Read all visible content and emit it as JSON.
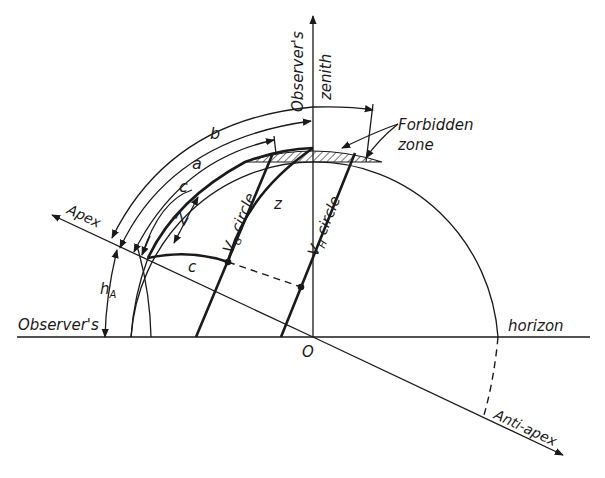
{
  "diagram": {
    "type": "celestial-geometry",
    "labels": {
      "zenith_line1": "Observer's",
      "zenith_line2": "zenith",
      "forbidden_line1": "Forbidden",
      "forbidden_line2": "zone",
      "apex": "Apex",
      "anti_apex": "Anti-apex",
      "horizon_left": "Observer's",
      "horizon_right": "horizon",
      "origin": "O",
      "arc_b": "b",
      "arc_a": "a",
      "arc_c_outer": "c",
      "arc_Z": "Z",
      "arc_c_inner": "c",
      "arc_z": "z",
      "h_A": "h",
      "h_A_sub": "A",
      "vg_circle": "V",
      "vg_sub": "G",
      "vg_word": " circle",
      "vh_circle": "V",
      "vh_sub": "H",
      "vh_word": " circle"
    },
    "colors": {
      "ink": "#1a1a1a",
      "background": "#ffffff"
    }
  }
}
